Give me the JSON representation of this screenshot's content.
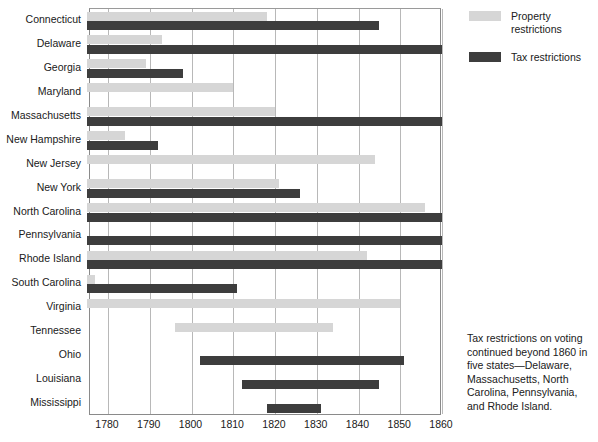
{
  "chart_data": {
    "type": "bar",
    "orientation": "horizontal",
    "title": "",
    "subtitle": "",
    "xlabel": "",
    "ylabel": "",
    "xlim": [
      1775,
      1860
    ],
    "grid": true,
    "grid_axis": "x",
    "xticks": [
      1780,
      1790,
      1800,
      1810,
      1820,
      1830,
      1840,
      1850,
      1860
    ],
    "xticklabels": [
      "1780",
      "1790",
      "1800",
      "1810",
      "1820",
      "1830",
      "1840",
      "1850",
      "1860"
    ],
    "legend_position": "top-right",
    "series": [
      {
        "name": "Property restrictions",
        "key": "property",
        "color": "#d6d6d6",
        "spans": [
          {
            "category": "Connecticut",
            "start": 1775,
            "end": 1818
          },
          {
            "category": "Delaware",
            "start": 1775,
            "end": 1793
          },
          {
            "category": "Georgia",
            "start": 1775,
            "end": 1789
          },
          {
            "category": "Maryland",
            "start": 1775,
            "end": 1810
          },
          {
            "category": "Massachusetts",
            "start": 1775,
            "end": 1820
          },
          {
            "category": "New Hampshire",
            "start": 1775,
            "end": 1784
          },
          {
            "category": "New Jersey",
            "start": 1775,
            "end": 1844
          },
          {
            "category": "New York",
            "start": 1775,
            "end": 1821
          },
          {
            "category": "North Carolina",
            "start": 1775,
            "end": 1856
          },
          {
            "category": "Pennsylvania",
            "start": 1775,
            "end": 1775
          },
          {
            "category": "Rhode Island",
            "start": 1775,
            "end": 1842
          },
          {
            "category": "South Carolina",
            "start": 1775,
            "end": 1777
          },
          {
            "category": "Virginia",
            "start": 1775,
            "end": 1850
          },
          {
            "category": "Tennessee",
            "start": 1796,
            "end": 1834
          },
          {
            "category": "Ohio",
            "start": 1775,
            "end": 1775
          },
          {
            "category": "Louisiana",
            "start": 1775,
            "end": 1775
          },
          {
            "category": "Mississippi",
            "start": 1775,
            "end": 1775
          }
        ]
      },
      {
        "name": "Tax restrictions",
        "key": "tax",
        "color": "#3d3d3d",
        "spans": [
          {
            "category": "Connecticut",
            "start": 1775,
            "end": 1845
          },
          {
            "category": "Delaware",
            "start": 1775,
            "end": 1860
          },
          {
            "category": "Georgia",
            "start": 1775,
            "end": 1798
          },
          {
            "category": "Maryland",
            "start": 1775,
            "end": 1775
          },
          {
            "category": "Massachusetts",
            "start": 1775,
            "end": 1860
          },
          {
            "category": "New Hampshire",
            "start": 1775,
            "end": 1792
          },
          {
            "category": "New Jersey",
            "start": 1775,
            "end": 1775
          },
          {
            "category": "New York",
            "start": 1775,
            "end": 1826
          },
          {
            "category": "North Carolina",
            "start": 1775,
            "end": 1860
          },
          {
            "category": "Pennsylvania",
            "start": 1775,
            "end": 1860
          },
          {
            "category": "Rhode Island",
            "start": 1775,
            "end": 1860
          },
          {
            "category": "South Carolina",
            "start": 1775,
            "end": 1811
          },
          {
            "category": "Virginia",
            "start": 1775,
            "end": 1775
          },
          {
            "category": "Tennessee",
            "start": 1775,
            "end": 1775
          },
          {
            "category": "Ohio",
            "start": 1802,
            "end": 1851
          },
          {
            "category": "Louisiana",
            "start": 1812,
            "end": 1845
          },
          {
            "category": "Mississippi",
            "start": 1818,
            "end": 1831
          }
        ]
      }
    ],
    "categories": [
      "Connecticut",
      "Delaware",
      "Georgia",
      "Maryland",
      "Massachusetts",
      "New Hampshire",
      "New Jersey",
      "New York",
      "North Carolina",
      "Pennsylvania",
      "Rhode Island",
      "South Carolina",
      "Virginia",
      "Tennessee",
      "Ohio",
      "Louisiana",
      "Mississippi"
    ],
    "annotations": [
      {
        "name": "tax-restrictions-note",
        "text": "Tax restrictions on voting continued beyond 1860 in five states—Delaware, Massachusetts, North Carolina, Pennsylvania, and Rhode Island."
      }
    ]
  },
  "legend": {
    "items": [
      {
        "label": "Property restrictions",
        "color": "#d6d6d6"
      },
      {
        "label": "Tax restrictions",
        "color": "#3d3d3d"
      }
    ]
  },
  "footnote": {
    "text": "Tax restrictions on voting continued beyond 1860 in five states—Delaware, Massachusetts, North Carolina, Pennsylvania, and Rhode Island."
  },
  "colors": {
    "property": "#d6d6d6",
    "tax": "#3d3d3d",
    "gridline": "#b8b8b8",
    "axis": "#8a8a8a",
    "text": "#202020",
    "background": "#ffffff"
  }
}
